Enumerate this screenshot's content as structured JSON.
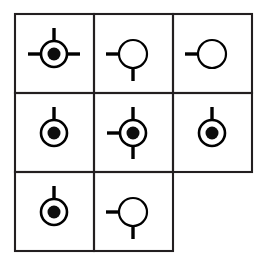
{
  "figure": {
    "background_color": "#ffffff",
    "ink_color": "#000000",
    "grid_line_color": "#231f20"
  },
  "grid": {
    "rows": 3,
    "cols": 3,
    "origin_x": 15,
    "origin_y": 14,
    "cell_width": 79,
    "cell_height": 79,
    "line_width": 2.1,
    "missing_cells": [
      "r3c3"
    ],
    "row_extents": [
      3,
      3,
      2
    ]
  },
  "symbol_style": {
    "outer_radius_filled": 13,
    "outer_radius_empty": 14,
    "core_radius": 6.5,
    "stub_length": 13,
    "stub_width": 3.4
  },
  "cells": [
    {
      "id": "r1c1",
      "row": 1,
      "col": 1,
      "center_x": 54,
      "center_y": 54,
      "fill": "filled",
      "stubs": [
        "left",
        "right",
        "top"
      ],
      "stub_count": 3
    },
    {
      "id": "r1c2",
      "row": 1,
      "col": 2,
      "center_x": 133,
      "center_y": 54,
      "fill": "empty",
      "stubs": [
        "left",
        "bottom"
      ],
      "stub_count": 2
    },
    {
      "id": "r1c3",
      "row": 1,
      "col": 3,
      "center_x": 212,
      "center_y": 54,
      "fill": "empty",
      "stubs": [
        "left"
      ],
      "stub_count": 1
    },
    {
      "id": "r2c1",
      "row": 2,
      "col": 1,
      "center_x": 54,
      "center_y": 133,
      "fill": "filled",
      "stubs": [
        "top"
      ],
      "stub_count": 1
    },
    {
      "id": "r2c2",
      "row": 2,
      "col": 2,
      "center_x": 133,
      "center_y": 133,
      "fill": "filled",
      "stubs": [
        "left",
        "top",
        "bottom"
      ],
      "stub_count": 3
    },
    {
      "id": "r2c3",
      "row": 2,
      "col": 3,
      "center_x": 212,
      "center_y": 133,
      "fill": "filled",
      "stubs": [
        "top"
      ],
      "stub_count": 1
    },
    {
      "id": "r3c1",
      "row": 3,
      "col": 1,
      "center_x": 54,
      "center_y": 212,
      "fill": "filled",
      "stubs": [
        "top"
      ],
      "stub_count": 1
    },
    {
      "id": "r3c2",
      "row": 3,
      "col": 2,
      "center_x": 133,
      "center_y": 212,
      "fill": "empty",
      "stubs": [
        "left",
        "bottom"
      ],
      "stub_count": 2
    }
  ]
}
